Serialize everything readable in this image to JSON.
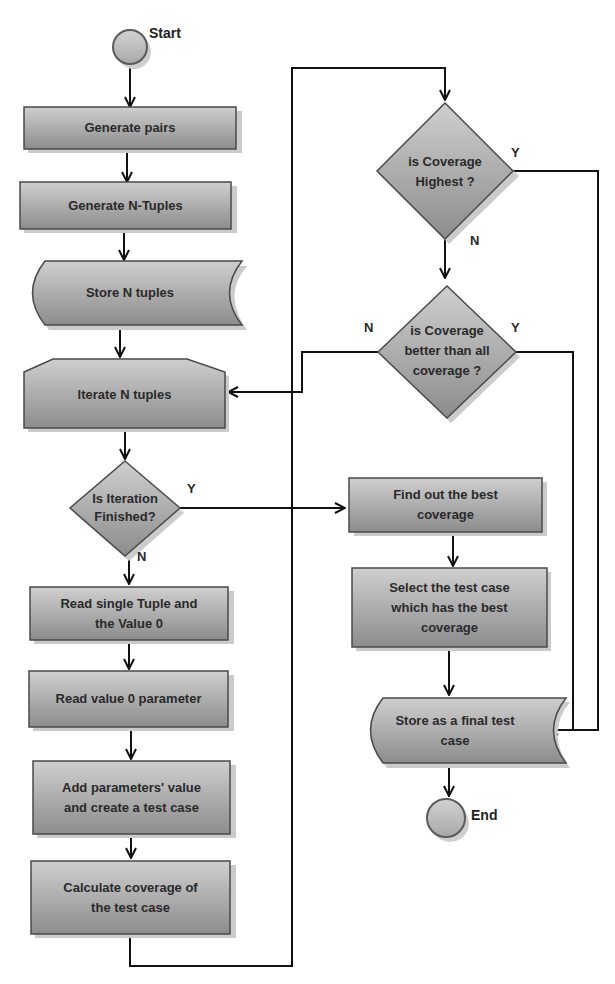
{
  "diagram": {
    "type": "flowchart",
    "colors": {
      "shape_fill_top": "#c8c8c8",
      "shape_fill_bottom": "#8a8a8a",
      "shape_stroke": "#4a4a4a",
      "shadow": "#c9c9c9",
      "terminal_fill": "#bdbdbd",
      "line": "#111111",
      "background": "#ffffff"
    },
    "nodes": {
      "start": {
        "label": "Start",
        "shape": "circle"
      },
      "generate_pairs": {
        "label": "Generate pairs",
        "shape": "process"
      },
      "generate_ntuples": {
        "label": "Generate N-Tuples",
        "shape": "process"
      },
      "store_ntuples": {
        "label": "Store N tuples",
        "shape": "stored-data"
      },
      "iterate_ntuples": {
        "label": "Iterate N tuples",
        "shape": "loop-limit"
      },
      "is_iteration_finished": {
        "label_line1": "Is Iteration",
        "label_line2": "Finished?",
        "shape": "decision"
      },
      "read_single_tuple": {
        "label_line1": "Read single Tuple and",
        "label_line2": "the Value 0",
        "shape": "process"
      },
      "read_value0_param": {
        "label": "Read value 0 parameter",
        "shape": "process"
      },
      "add_params_value": {
        "label_line1": "Add parameters' value",
        "label_line2": "and create a test case",
        "shape": "process"
      },
      "calculate_coverage": {
        "label_line1": "Calculate coverage of",
        "label_line2": "the test case",
        "shape": "process"
      },
      "is_coverage_highest": {
        "label_line1": "is Coverage",
        "label_line2": "Highest ?",
        "shape": "decision"
      },
      "is_coverage_better": {
        "label_line1": "is Coverage",
        "label_line2": "better than all",
        "label_line3": "coverage ?",
        "shape": "decision"
      },
      "find_best_coverage": {
        "label_line1": "Find out the best",
        "label_line2": "coverage",
        "shape": "process"
      },
      "select_test_case": {
        "label_line1": "Select the test case",
        "label_line2": "which has the best",
        "label_line3": "coverage",
        "shape": "process"
      },
      "store_final": {
        "label_line1": "Store as a final test",
        "label_line2": "case",
        "shape": "stored-data"
      },
      "end": {
        "label": "End",
        "shape": "circle"
      }
    },
    "edge_labels": {
      "iteration_yes": "Y",
      "iteration_no": "N",
      "highest_yes": "Y",
      "highest_no": "N",
      "better_no": "N",
      "better_yes": "Y"
    },
    "edges": [
      {
        "from": "start",
        "to": "generate_pairs"
      },
      {
        "from": "generate_pairs",
        "to": "generate_ntuples"
      },
      {
        "from": "generate_ntuples",
        "to": "store_ntuples"
      },
      {
        "from": "store_ntuples",
        "to": "iterate_ntuples"
      },
      {
        "from": "iterate_ntuples",
        "to": "is_iteration_finished"
      },
      {
        "from": "is_iteration_finished",
        "to": "read_single_tuple",
        "label": "N"
      },
      {
        "from": "is_iteration_finished",
        "to": "find_best_coverage",
        "label": "Y"
      },
      {
        "from": "read_single_tuple",
        "to": "read_value0_param"
      },
      {
        "from": "read_value0_param",
        "to": "add_params_value"
      },
      {
        "from": "add_params_value",
        "to": "calculate_coverage"
      },
      {
        "from": "calculate_coverage",
        "to": "is_coverage_highest"
      },
      {
        "from": "is_coverage_highest",
        "to": "store_final",
        "label": "Y"
      },
      {
        "from": "is_coverage_highest",
        "to": "is_coverage_better",
        "label": "N"
      },
      {
        "from": "is_coverage_better",
        "to": "iterate_ntuples",
        "label": "N"
      },
      {
        "from": "is_coverage_better",
        "to": "store_final",
        "label": "Y"
      },
      {
        "from": "find_best_coverage",
        "to": "select_test_case"
      },
      {
        "from": "select_test_case",
        "to": "store_final"
      },
      {
        "from": "store_final",
        "to": "end"
      }
    ]
  }
}
